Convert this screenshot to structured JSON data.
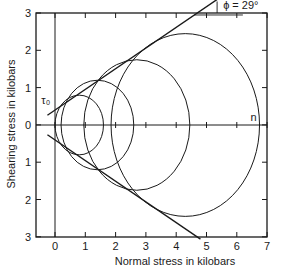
{
  "chart_data": {
    "type": "diagram-mohr-circles",
    "title": "",
    "xlabel": "Normal stress in kilobars",
    "ylabel": "Shearing stress in kilobars",
    "xlim": [
      -0.6,
      7
    ],
    "ylim": [
      -3,
      3
    ],
    "x_ticks": [
      "0",
      "1",
      "2",
      "3",
      "4",
      "5",
      "6",
      "7"
    ],
    "y_ticks": [
      "3",
      "2",
      "1",
      "0",
      "1",
      "2",
      "3"
    ],
    "grid": false,
    "circles": [
      {
        "center": 0.8,
        "radius": 0.8
      },
      {
        "center": 1.4,
        "radius": 1.2
      },
      {
        "center": 2.7,
        "radius": 1.75
      },
      {
        "center": 4.3,
        "radius": 2.45
      }
    ],
    "envelope": {
      "cohesion_tau0": 0.4,
      "friction_angle_deg": 29
    },
    "annotations": {
      "phi": "ϕ = 29°",
      "tau0": "τ₀",
      "n": "n"
    }
  }
}
